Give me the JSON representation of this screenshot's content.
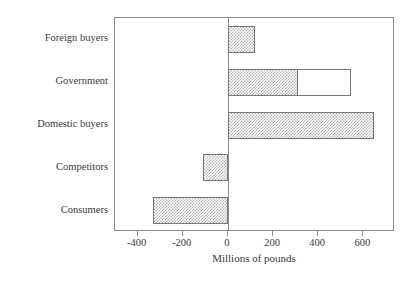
{
  "chart_data": {
    "type": "bar",
    "orientation": "horizontal",
    "title": "",
    "subtitle": "",
    "xlabel": "Millions of pounds",
    "ylabel": "",
    "xlim": [
      -500,
      740
    ],
    "xticks": [
      -400,
      -200,
      0,
      200,
      400,
      600
    ],
    "xticklabels": [
      "-400",
      "-200",
      "0",
      "200",
      "400",
      "600"
    ],
    "grid": false,
    "legend": null,
    "categories": [
      "Foreign buyers",
      "Government",
      "Domestic buyers",
      "Competitors",
      "Consumers"
    ],
    "values": [
      120,
      545,
      645,
      -110,
      -330
    ],
    "series": [
      {
        "name": "shaded",
        "fill": "hatched-gray",
        "values": [
          120,
          310,
          645,
          -110,
          -330
        ]
      },
      {
        "name": "open",
        "fill": "white-outline",
        "values": [
          0,
          545,
          0,
          0,
          0
        ]
      }
    ]
  },
  "axis": {
    "x_title": "Millions of pounds",
    "ticks": [
      {
        "value": -400,
        "label": "-400"
      },
      {
        "value": -200,
        "label": "-200"
      },
      {
        "value": 0,
        "label": "0"
      },
      {
        "value": 200,
        "label": "200"
      },
      {
        "value": 400,
        "label": "400"
      },
      {
        "value": 600,
        "label": "600"
      }
    ]
  },
  "categories": [
    {
      "label": "Foreign buyers"
    },
    {
      "label": "Government"
    },
    {
      "label": "Domestic buyers"
    },
    {
      "label": "Competitors"
    },
    {
      "label": "Consumers"
    }
  ],
  "colors": {
    "frame": "#8d8d8d",
    "bar_outline": "#777777",
    "bar_fill": "#b0b0b0",
    "open_fill": "#ffffff",
    "text": "#3a3a3a",
    "background": "#ffffff"
  }
}
